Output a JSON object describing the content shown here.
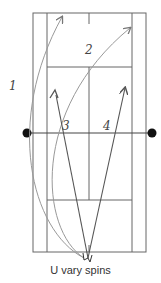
{
  "diagram": {
    "type": "tennis-court-shot-diagram",
    "caption": "U vary spins",
    "shot_labels": [
      "1",
      "2",
      "3",
      "4"
    ],
    "colors": {
      "court_lines": "#666666",
      "arc_lines": "#999999",
      "straight_arrows": "#555555",
      "net_posts": "#111111",
      "background": "#ffffff"
    },
    "court": {
      "outer": {
        "x1": 33,
        "y1": 13,
        "x2": 146,
        "y2": 252
      },
      "singles_x": [
        47,
        132
      ],
      "service_line_y": [
        67,
        200
      ],
      "center_line_x": 89,
      "net_y": 133,
      "net_posts_x": [
        27,
        152
      ]
    }
  }
}
